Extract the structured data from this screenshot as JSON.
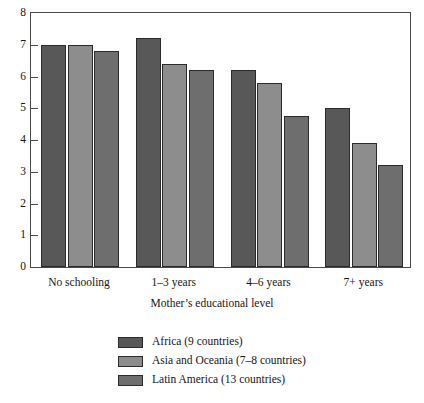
{
  "chart_data": {
    "type": "bar",
    "title": "",
    "subtitle": "",
    "xlabel": "Mother’s educational level",
    "ylabel": "",
    "categories": [
      "No schooling",
      "1–3 years",
      "4–6 years",
      "7+ years"
    ],
    "series": [
      {
        "name": "Africa (9 countries)",
        "color": "#585858",
        "values": [
          7.0,
          7.2,
          6.2,
          5.0
        ]
      },
      {
        "name": "Asia and Oceania (7–8 countries)",
        "color": "#8d8d8d",
        "values": [
          7.0,
          6.4,
          5.8,
          3.9
        ]
      },
      {
        "name": "Latin America (13 countries)",
        "color": "#6e6e6e",
        "values": [
          6.8,
          6.2,
          4.75,
          3.2
        ]
      }
    ],
    "ylim": [
      0,
      8
    ],
    "yticks": [
      0,
      1,
      2,
      3,
      4,
      5,
      6,
      7,
      8
    ],
    "ytick_labels": [
      "0",
      "1",
      "2",
      "3",
      "4",
      "5",
      "6",
      "7",
      "8"
    ],
    "grid": false,
    "legend_position": "bottom-center",
    "bar_outline_color": "#2b2b2b",
    "frame_color": "#4a4a4a"
  }
}
